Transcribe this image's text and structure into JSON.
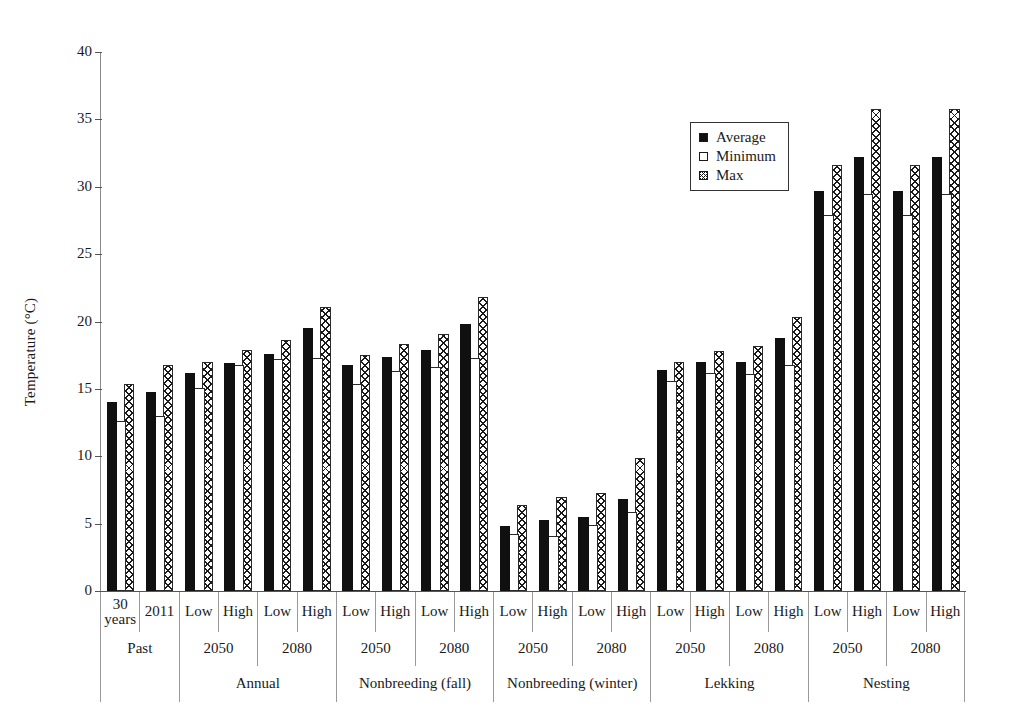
{
  "chart_data": {
    "type": "bar",
    "title": "",
    "xlabel": "",
    "ylabel": "Temperature (°C)",
    "ylim": [
      0,
      40
    ],
    "yticks": [
      0,
      5,
      10,
      15,
      20,
      25,
      30,
      35,
      40
    ],
    "grid": false,
    "legend_position": "top-right",
    "legend": [
      "Average",
      "Minimum",
      "Max"
    ],
    "series": [
      {
        "name": "Average",
        "values": [
          14.0,
          14.8,
          16.2,
          16.9,
          17.6,
          19.5,
          16.8,
          17.4,
          17.9,
          19.8,
          4.8,
          5.3,
          5.5,
          6.8,
          16.4,
          17.0,
          17.0,
          18.8,
          29.7,
          32.2,
          29.7,
          32.2
        ]
      },
      {
        "name": "Minimum",
        "values": [
          12.6,
          13.0,
          15.1,
          16.8,
          17.2,
          17.3,
          15.4,
          16.3,
          16.6,
          17.3,
          4.2,
          4.1,
          4.9,
          5.9,
          15.6,
          16.2,
          16.1,
          16.8,
          27.9,
          29.5,
          27.9,
          29.5
        ]
      },
      {
        "name": "Max",
        "values": [
          15.4,
          16.8,
          17.0,
          17.9,
          18.6,
          21.1,
          17.5,
          18.3,
          19.1,
          21.8,
          6.4,
          7.0,
          7.3,
          9.9,
          17.0,
          17.8,
          18.2,
          20.3,
          31.6,
          35.8,
          31.6,
          35.8
        ]
      }
    ],
    "categories": [
      "Past / 30 years",
      "Past / 2011",
      "Annual 2050 Low",
      "Annual 2050 High",
      "Annual 2080 Low",
      "Annual 2080 High",
      "Nonbreeding (fall) 2050 Low",
      "Nonbreeding (fall) 2050 High",
      "Nonbreeding (fall) 2080 Low",
      "Nonbreeding (fall) 2080 High",
      "Nonbreeding (winter) 2050 Low",
      "Nonbreeding (winter) 2050 High",
      "Nonbreeding (winter) 2080 Low",
      "Nonbreeding (winter) 2080 High",
      "Lekking 2050 Low",
      "Lekking 2050 High",
      "Lekking 2080 Low",
      "Lekking 2080 High",
      "Nesting 2050 Low",
      "Nesting 2050 High",
      "Nesting 2080 Low",
      "Nesting 2080 High"
    ],
    "axis_table": {
      "level1": [
        "30 years",
        "2011",
        "Low",
        "High",
        "Low",
        "High",
        "Low",
        "High",
        "Low",
        "High",
        "Low",
        "High",
        "Low",
        "High",
        "Low",
        "High",
        "Low",
        "High",
        "Low",
        "High",
        "Low",
        "High"
      ],
      "level2": [
        {
          "label": "Past",
          "span": 2
        },
        {
          "label": "2050",
          "span": 2
        },
        {
          "label": "2080",
          "span": 2
        },
        {
          "label": "2050",
          "span": 2
        },
        {
          "label": "2080",
          "span": 2
        },
        {
          "label": "2050",
          "span": 2
        },
        {
          "label": "2080",
          "span": 2
        },
        {
          "label": "2050",
          "span": 2
        },
        {
          "label": "2080",
          "span": 2
        },
        {
          "label": "2050",
          "span": 2
        },
        {
          "label": "2080",
          "span": 2
        }
      ],
      "level3": [
        {
          "label": "",
          "span": 2
        },
        {
          "label": "Annual",
          "span": 4
        },
        {
          "label": "Nonbreeding (fall)",
          "span": 4
        },
        {
          "label": "Nonbreeding (winter)",
          "span": 4
        },
        {
          "label": "Lekking",
          "span": 4
        },
        {
          "label": "Nesting",
          "span": 4
        }
      ]
    }
  }
}
